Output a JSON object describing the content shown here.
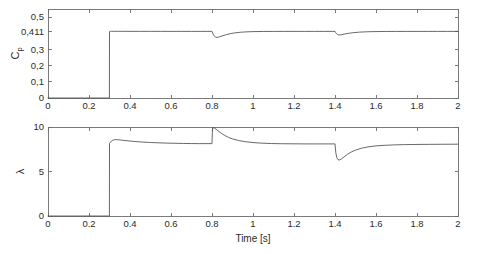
{
  "figure": {
    "background_color": "#ffffff",
    "line_color": "#4d4d4d",
    "axis_color": "#6b6b6b",
    "width": 479,
    "height": 254
  },
  "chart_data": [
    {
      "id": "cp-plot",
      "type": "line",
      "title": "",
      "xlabel": "",
      "ylabel": "C_p",
      "ylabel_base": "C",
      "ylabel_sub": "p",
      "xlim": [
        0,
        2
      ],
      "ylim": [
        0,
        0.55
      ],
      "grid": false,
      "legend": null,
      "xticks": [
        0,
        0.2,
        0.4,
        0.6,
        0.8,
        1,
        1.2,
        1.4,
        1.6,
        1.8,
        2
      ],
      "xticklabels": [
        "0",
        "0.2",
        "0.4",
        "0.6",
        "0.8",
        "1",
        "1.2",
        "1.4",
        "1.6",
        "1.8",
        "2"
      ],
      "yticks": [
        0,
        0.1,
        0.2,
        0.3,
        0.411,
        0.5
      ],
      "yticklabels": [
        "0",
        "0,1",
        "0,2",
        "0,3",
        "0,411",
        "0,5"
      ],
      "series": [
        {
          "name": "Cp",
          "x": [
            0,
            0.05,
            0.1,
            0.15,
            0.2,
            0.25,
            0.29,
            0.2995,
            0.3,
            0.302,
            0.305,
            0.31,
            0.32,
            0.34,
            0.36,
            0.4,
            0.45,
            0.5,
            0.55,
            0.6,
            0.65,
            0.7,
            0.75,
            0.78,
            0.7995,
            0.8,
            0.803,
            0.807,
            0.812,
            0.818,
            0.825,
            0.835,
            0.85,
            0.87,
            0.89,
            0.91,
            0.94,
            0.97,
            1.0,
            1.05,
            1.1,
            1.15,
            1.2,
            1.25,
            1.3,
            1.35,
            1.39,
            1.3995,
            1.4,
            1.403,
            1.407,
            1.412,
            1.418,
            1.425,
            1.435,
            1.45,
            1.47,
            1.49,
            1.52,
            1.56,
            1.6,
            1.65,
            1.7,
            1.75,
            1.8,
            1.85,
            1.9,
            1.95,
            2.0
          ],
          "y": [
            0,
            0,
            0,
            0,
            0,
            0,
            0,
            0,
            0.411,
            0.4118,
            0.412,
            0.4122,
            0.4122,
            0.4121,
            0.412,
            0.412,
            0.4119,
            0.4119,
            0.4118,
            0.4118,
            0.4118,
            0.4117,
            0.4117,
            0.4117,
            0.4117,
            0.4117,
            0.4015,
            0.3905,
            0.3815,
            0.3762,
            0.3745,
            0.3775,
            0.3842,
            0.3918,
            0.3978,
            0.4022,
            0.4065,
            0.4089,
            0.4102,
            0.4112,
            0.4115,
            0.4116,
            0.4117,
            0.4117,
            0.4117,
            0.4117,
            0.4117,
            0.4117,
            0.4117,
            0.4048,
            0.3975,
            0.3925,
            0.3898,
            0.3895,
            0.3918,
            0.3962,
            0.4005,
            0.4038,
            0.4072,
            0.4095,
            0.4105,
            0.4112,
            0.4114,
            0.4115,
            0.4116,
            0.4116,
            0.4116,
            0.4117,
            0.4117
          ]
        }
      ],
      "annotations": [
        {
          "label": "step up at t=0.3 s to Cp=0.411"
        },
        {
          "label": "dip at t=0.8 s, min approx 0.374"
        },
        {
          "label": "dip at t=1.4 s, min approx 0.389"
        }
      ]
    },
    {
      "id": "lambda-plot",
      "type": "line",
      "title": "",
      "xlabel": "Time [s]",
      "ylabel": "λ",
      "xlim": [
        0,
        2
      ],
      "ylim": [
        0,
        10
      ],
      "grid": false,
      "legend": null,
      "xticks": [
        0,
        0.2,
        0.4,
        0.6,
        0.8,
        1,
        1.2,
        1.4,
        1.6,
        1.8,
        2
      ],
      "xticklabels": [
        "0",
        "0.2",
        "0.4",
        "0.6",
        "0.8",
        "1",
        "1.2",
        "1.4",
        "1.6",
        "1.8",
        "2"
      ],
      "yticks": [
        0,
        5,
        10
      ],
      "yticklabels": [
        "0",
        "5",
        "10"
      ],
      "series": [
        {
          "name": "lambda",
          "x": [
            0,
            0.05,
            0.1,
            0.15,
            0.2,
            0.25,
            0.29,
            0.2995,
            0.3,
            0.305,
            0.31,
            0.315,
            0.322,
            0.33,
            0.34,
            0.35,
            0.36,
            0.38,
            0.4,
            0.43,
            0.46,
            0.5,
            0.54,
            0.58,
            0.62,
            0.66,
            0.7,
            0.74,
            0.78,
            0.7995,
            0.8,
            0.802,
            0.806,
            0.812,
            0.82,
            0.83,
            0.845,
            0.86,
            0.88,
            0.9,
            0.93,
            0.96,
            1.0,
            1.04,
            1.09,
            1.14,
            1.2,
            1.26,
            1.32,
            1.36,
            1.39,
            1.3995,
            1.4,
            1.404,
            1.409,
            1.415,
            1.422,
            1.432,
            1.445,
            1.46,
            1.48,
            1.5,
            1.53,
            1.56,
            1.6,
            1.64,
            1.69,
            1.74,
            1.8,
            1.86,
            1.92,
            2.0
          ],
          "y": [
            0,
            0,
            0,
            0,
            0,
            0,
            0,
            0,
            8.15,
            8.3,
            8.42,
            8.5,
            8.56,
            8.58,
            8.57,
            8.55,
            8.52,
            8.47,
            8.42,
            8.36,
            8.31,
            8.26,
            8.22,
            8.19,
            8.17,
            8.15,
            8.14,
            8.13,
            8.13,
            8.13,
            8.13,
            9.72,
            9.92,
            9.88,
            9.75,
            9.56,
            9.3,
            9.08,
            8.84,
            8.66,
            8.48,
            8.36,
            8.25,
            8.19,
            8.14,
            8.12,
            8.11,
            8.1,
            8.1,
            8.1,
            8.1,
            8.1,
            8.1,
            7.1,
            6.55,
            6.32,
            6.3,
            6.42,
            6.66,
            6.92,
            7.2,
            7.4,
            7.62,
            7.76,
            7.88,
            7.94,
            7.99,
            8.02,
            8.04,
            8.05,
            8.06,
            8.07
          ]
        }
      ],
      "annotations": [
        {
          "label": "step up at t=0.3 s, overshoot to approx 8.6"
        },
        {
          "label": "spike at t=0.8 s up to approx 9.9"
        },
        {
          "label": "drop at t=1.4 s down to approx 6.3"
        }
      ]
    }
  ]
}
